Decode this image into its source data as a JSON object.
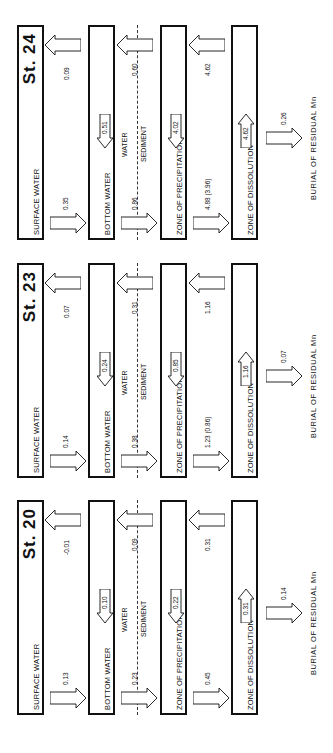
{
  "diagram": {
    "type": "Mn flux box model (rotated)",
    "labels": {
      "surface_water": "SURFACE WATER",
      "bottom_water": "BOTTOM WATER",
      "water": "WATER",
      "sediment": "SEDIMENT",
      "zone_precipitation": "ZONE OF PRECIPITATION",
      "zone_dissolution": "ZONE OF DISSOLUTION",
      "burial": "BURIAL OF RESIDUAL Mn"
    },
    "stations": [
      {
        "title": "St. 20",
        "down_surface_to_bottom": "0.13",
        "up_bottom_to_surface": "-0.01",
        "bottom_internal": "0.10",
        "down_water_to_sediment": "0.23",
        "up_sediment_to_water": "0.09",
        "precipitation_internal": "0.22",
        "down_precip_to_dissolution": "0.45",
        "up_dissolution_to_precip": "0.31",
        "dissolution_internal": "0.31",
        "burial": "0.14"
      },
      {
        "title": "St. 23",
        "down_surface_to_bottom": "0.14",
        "up_bottom_to_surface": "0.07",
        "bottom_internal": "0.24",
        "down_water_to_sediment": "0.38",
        "up_sediment_to_water": "0.31",
        "precipitation_internal": "0.85",
        "down_precip_to_dissolution": "1.23 (0.86)",
        "up_dissolution_to_precip": "1.16",
        "dissolution_internal": "1.16",
        "burial": "0.07"
      },
      {
        "title": "St. 24",
        "down_surface_to_bottom": "0.35",
        "up_bottom_to_surface": "0.09",
        "bottom_internal": "0.51",
        "down_water_to_sediment": "0.86",
        "up_sediment_to_water": "0.60",
        "precipitation_internal": "4.02",
        "down_precip_to_dissolution": "4.88 (3.96)",
        "up_dissolution_to_precip": "4.62",
        "dissolution_internal": "4.62",
        "burial": "0.26"
      }
    ]
  }
}
